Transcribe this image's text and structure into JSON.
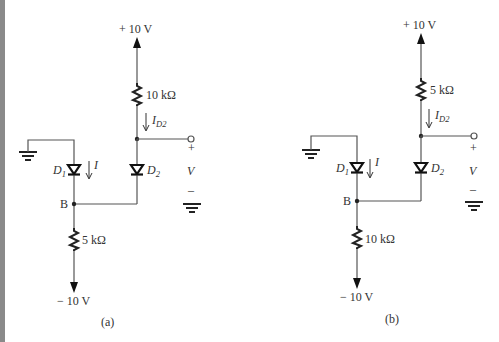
{
  "figure": {
    "panels": [
      {
        "id": "a",
        "caption": "(a)",
        "supply_top": "+ 10 V",
        "supply_bottom": "− 10 V",
        "resistor_top": "10 kΩ",
        "resistor_bottom": "5 kΩ",
        "current_main": "I",
        "current_d2": "I",
        "current_d2_sub": "D2",
        "diode1": "D",
        "diode1_sub": "1",
        "diode2": "D",
        "diode2_sub": "2",
        "node_label": "B",
        "output_plus": "+",
        "output_var": "V",
        "output_minus": "–"
      },
      {
        "id": "b",
        "caption": "(b)",
        "supply_top": "+ 10 V",
        "supply_bottom": "− 10 V",
        "resistor_top": "5 kΩ",
        "resistor_bottom": "10 kΩ",
        "current_main": "I",
        "current_d2": "I",
        "current_d2_sub": "D2",
        "diode1": "D",
        "diode1_sub": "1",
        "diode2": "D",
        "diode2_sub": "2",
        "node_label": "B",
        "output_plus": "+",
        "output_var": "V",
        "output_minus": "–"
      }
    ],
    "colors": {
      "wire": "#555555",
      "ink": "#222222",
      "edge_strip": "#8a8a8a"
    }
  }
}
